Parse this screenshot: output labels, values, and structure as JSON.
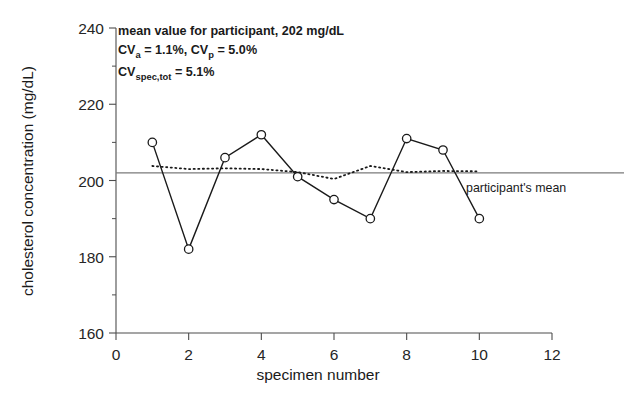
{
  "chart_data": {
    "type": "line",
    "title": "",
    "xlabel": "specimen number",
    "ylabel": "cholesterol concentration (mg/dL)",
    "xlim": [
      0,
      12
    ],
    "ylim": [
      160,
      240
    ],
    "x_ticks": [
      "0",
      "2",
      "4",
      "6",
      "8",
      "10",
      "12"
    ],
    "y_ticks": [
      "160",
      "180",
      "200",
      "220",
      "240"
    ],
    "x_tick_values": [
      0,
      2,
      4,
      6,
      8,
      10,
      12
    ],
    "y_tick_values": [
      160,
      180,
      200,
      220,
      240
    ],
    "x_minor_values": [
      1,
      3,
      5,
      7,
      9,
      11
    ],
    "y_minor_values": [
      170,
      190,
      210,
      230
    ],
    "grid": false,
    "legend_position": "none",
    "x": [
      1,
      2,
      3,
      4,
      5,
      6,
      7,
      8,
      9,
      10
    ],
    "series": [
      {
        "name": "specimen measurements",
        "style": "solid-with-open-circle-markers",
        "values": [
          210,
          182,
          206,
          212,
          201,
          195,
          190,
          211,
          208,
          190
        ]
      },
      {
        "name": "analytical replicate trend",
        "style": "dotted",
        "values": [
          203.8,
          203.0,
          203.2,
          203.0,
          202.2,
          200.4,
          203.8,
          202.2,
          202.5,
          202.4
        ]
      }
    ],
    "reference_line": {
      "value": 202,
      "label": "participant's mean",
      "color": "#7a7a7a"
    },
    "annotations": [
      {
        "id": "mean-note",
        "text": "mean value for participant, 202 mg/dL"
      },
      {
        "id": "cv-line-1",
        "parts": [
          "CV",
          "a",
          " = 1.1%, CV",
          "p",
          " = 5.0%"
        ]
      },
      {
        "id": "cv-line-2",
        "parts": [
          "CV",
          "spec,tot",
          " = 5.1%"
        ]
      }
    ],
    "annotation_flat": {
      "line1": "mean value for participant, 202 mg/dL",
      "line2_a": "CV",
      "line2_sub_a": "a",
      "line2_b": " = 1.1%, CV",
      "line2_sub_b": "p",
      "line2_c": " = 5.0%",
      "line3_a": "CV",
      "line3_sub": "spec,tot",
      "line3_b": " = 5.1%"
    }
  }
}
